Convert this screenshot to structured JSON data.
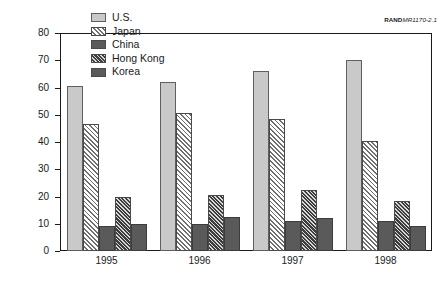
{
  "figure": {
    "source_credit_bold": "RAND",
    "source_credit_italic": "MR1170-2.1"
  },
  "chart_data": {
    "type": "bar",
    "title": "",
    "xlabel": "",
    "ylabel": "Billions of U.S. dollars",
    "categories": [
      "1995",
      "1996",
      "1997",
      "1998"
    ],
    "ylim": [
      0,
      80
    ],
    "yticks": [
      0,
      10,
      20,
      30,
      40,
      50,
      60,
      70,
      80
    ],
    "ytick_labels": [
      "0",
      "10",
      "20",
      "30",
      "40",
      "50",
      "60",
      "70",
      "80"
    ],
    "grid": false,
    "legend_position": "inside top-left",
    "series": [
      {
        "name": "U.S.",
        "values": [
          60.5,
          62.0,
          66.0,
          70.0
        ],
        "color": "#c9c9c9",
        "pattern": "solid-light-gray"
      },
      {
        "name": "Japan",
        "values": [
          46.5,
          50.5,
          48.5,
          40.5
        ],
        "color": "#ffffff",
        "pattern": "diagonal-hatch"
      },
      {
        "name": "China",
        "values": [
          9.0,
          10.0,
          11.0,
          11.0
        ],
        "color": "#5a5a5a",
        "pattern": "solid-dark-gray"
      },
      {
        "name": "Hong Kong",
        "values": [
          20.0,
          20.5,
          22.5,
          18.5
        ],
        "color": "#b5b5b5",
        "pattern": "dense-diagonal-hatch"
      },
      {
        "name": "Korea",
        "values": [
          10.0,
          12.5,
          12.0,
          9.0
        ],
        "color": "#5a5a5a",
        "pattern": "solid-dark-gray"
      }
    ]
  }
}
